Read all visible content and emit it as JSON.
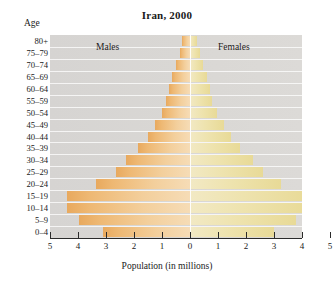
{
  "chart_data": {
    "type": "bar",
    "subtype": "population-pyramid",
    "title": "Iran, 2000",
    "xlabel": "Population (in millions)",
    "ylabel": "Age",
    "xlim": [
      -5,
      5
    ],
    "x_ticks": [
      "5",
      "4",
      "3",
      "2",
      "1",
      "0",
      "1",
      "2",
      "3",
      "4",
      "5"
    ],
    "x_tick_values": [
      -5,
      -4,
      -3,
      -2,
      -1,
      0,
      1,
      2,
      3,
      4,
      5
    ],
    "grid": false,
    "legend": [
      "Males",
      "Females"
    ],
    "legend_position": "inside-top",
    "categories": [
      "80+",
      "75-79",
      "70-74",
      "65-69",
      "60-64",
      "55-59",
      "50-54",
      "45-49",
      "40-44",
      "35-39",
      "30-34",
      "25-29",
      "20-24",
      "15-19",
      "10-14",
      "5-9",
      "0-4"
    ],
    "series": [
      {
        "name": "Males",
        "color": "#eeb873",
        "values": [
          0.3,
          0.35,
          0.5,
          0.65,
          0.75,
          0.85,
          1.0,
          1.25,
          1.5,
          1.85,
          2.3,
          2.65,
          3.35,
          4.4,
          4.4,
          3.95,
          3.1
        ]
      },
      {
        "name": "Females",
        "color": "#eee3ae",
        "values": [
          0.25,
          0.35,
          0.45,
          0.6,
          0.7,
          0.8,
          0.95,
          1.2,
          1.45,
          1.8,
          2.25,
          2.6,
          3.25,
          4.25,
          4.25,
          3.8,
          3.0
        ]
      }
    ]
  },
  "colors": {
    "plot_background": "#d8d6d3",
    "male_bar": "#eeb873",
    "female_bar": "#eee3ae",
    "axis": "#2b2b2b",
    "page_background": "#ffffff"
  }
}
